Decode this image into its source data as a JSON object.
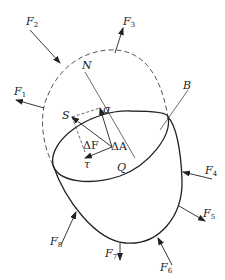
{
  "diagram": {
    "colors": {
      "stroke": "#222222",
      "background": "#ffffff"
    },
    "forces": [
      {
        "id": "F1",
        "label": "F",
        "sub": "1"
      },
      {
        "id": "F2",
        "label": "F",
        "sub": "2"
      },
      {
        "id": "F3",
        "label": "F",
        "sub": "3"
      },
      {
        "id": "F4",
        "label": "F",
        "sub": "4"
      },
      {
        "id": "F5",
        "label": "F",
        "sub": "5"
      },
      {
        "id": "F6",
        "label": "F",
        "sub": "6"
      },
      {
        "id": "F7",
        "label": "F",
        "sub": "7"
      },
      {
        "id": "F8",
        "label": "F",
        "sub": "8"
      }
    ],
    "labels": {
      "N": "N",
      "S": "S",
      "sigma": "σ",
      "tau": "τ",
      "deltaA": "ΔA",
      "deltaF": "ΔF",
      "Q": "Q",
      "B": "B"
    }
  }
}
